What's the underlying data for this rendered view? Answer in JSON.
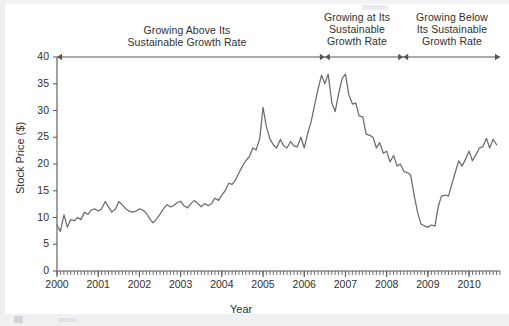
{
  "chart_data": {
    "type": "line",
    "title": "",
    "xlabel": "Year",
    "ylabel": "Stock Price ($)",
    "xlim": [
      2000,
      2010.75
    ],
    "ylim": [
      0,
      40
    ],
    "yticks": [
      0,
      5,
      10,
      15,
      20,
      25,
      30,
      35,
      40
    ],
    "xticks": [
      2000,
      2001,
      2002,
      2003,
      2004,
      2005,
      2006,
      2007,
      2008,
      2009,
      2010
    ],
    "xtick_labels": [
      "2000",
      "2001",
      "2002",
      "2003",
      "2004",
      "2005",
      "2006",
      "2007",
      "2008",
      "2009",
      "2010"
    ],
    "ytick_labels": [
      "0",
      "5",
      "10",
      "15",
      "20",
      "25",
      "30",
      "35",
      "40"
    ],
    "grid": false,
    "minor_ticks": "monthly",
    "line_color": "#6b6b6b",
    "axis_color": "#555555",
    "series": [
      {
        "name": "Stock Price",
        "x": [
          2000.0,
          2000.08,
          2000.17,
          2000.25,
          2000.33,
          2000.42,
          2000.5,
          2000.58,
          2000.67,
          2000.75,
          2000.83,
          2000.92,
          2001.0,
          2001.08,
          2001.17,
          2001.25,
          2001.33,
          2001.42,
          2001.5,
          2001.58,
          2001.67,
          2001.75,
          2001.83,
          2001.92,
          2002.0,
          2002.08,
          2002.17,
          2002.25,
          2002.33,
          2002.42,
          2002.5,
          2002.58,
          2002.67,
          2002.75,
          2002.83,
          2002.92,
          2003.0,
          2003.08,
          2003.17,
          2003.25,
          2003.33,
          2003.42,
          2003.5,
          2003.58,
          2003.67,
          2003.75,
          2003.83,
          2003.92,
          2004.0,
          2004.08,
          2004.17,
          2004.25,
          2004.33,
          2004.42,
          2004.5,
          2004.58,
          2004.67,
          2004.75,
          2004.83,
          2004.92,
          2005.0,
          2005.08,
          2005.17,
          2005.25,
          2005.33,
          2005.42,
          2005.5,
          2005.58,
          2005.67,
          2005.75,
          2005.83,
          2005.92,
          2006.0,
          2006.08,
          2006.17,
          2006.25,
          2006.33,
          2006.42,
          2006.5,
          2006.58,
          2006.67,
          2006.75,
          2006.83,
          2006.92,
          2007.0,
          2007.08,
          2007.17,
          2007.25,
          2007.33,
          2007.42,
          2007.5,
          2007.58,
          2007.67,
          2007.75,
          2007.83,
          2007.92,
          2008.0,
          2008.08,
          2008.17,
          2008.25,
          2008.33,
          2008.42,
          2008.5,
          2008.58,
          2008.67,
          2008.75,
          2008.83,
          2008.92,
          2009.0,
          2009.08,
          2009.17,
          2009.25,
          2009.33,
          2009.42,
          2009.5,
          2009.58,
          2009.67,
          2009.75,
          2009.83,
          2009.92,
          2010.0,
          2010.08,
          2010.17,
          2010.25,
          2010.33,
          2010.42,
          2010.5,
          2010.58,
          2010.67
        ],
        "values": [
          8.6,
          7.4,
          10.5,
          8.2,
          9.6,
          9.4,
          10.0,
          9.6,
          11.0,
          10.6,
          11.4,
          11.6,
          11.2,
          11.6,
          13.0,
          12.0,
          11.0,
          11.6,
          13.0,
          12.4,
          11.6,
          11.2,
          11.0,
          11.2,
          11.6,
          11.4,
          10.8,
          9.8,
          9.0,
          9.8,
          10.6,
          11.6,
          12.4,
          12.0,
          12.2,
          12.8,
          13.0,
          12.2,
          11.8,
          12.6,
          13.2,
          12.6,
          12.0,
          12.6,
          12.2,
          12.6,
          13.6,
          13.2,
          14.2,
          15.0,
          16.4,
          16.2,
          17.0,
          18.4,
          19.6,
          20.6,
          21.4,
          23.0,
          22.6,
          24.8,
          30.6,
          27.0,
          24.6,
          23.6,
          23.0,
          24.6,
          23.4,
          23.0,
          24.2,
          23.4,
          23.2,
          25.0,
          23.0,
          25.6,
          28.0,
          31.0,
          33.8,
          36.6,
          35.0,
          36.8,
          31.4,
          29.8,
          33.0,
          36.0,
          36.8,
          33.0,
          31.2,
          31.4,
          29.0,
          28.8,
          25.6,
          25.4,
          25.0,
          23.0,
          24.0,
          22.0,
          22.4,
          20.4,
          21.6,
          19.6,
          20.0,
          18.6,
          18.4,
          18.0,
          14.0,
          11.0,
          8.8,
          8.4,
          8.2,
          8.6,
          8.4,
          12.0,
          14.0,
          14.2,
          14.0,
          16.2,
          18.6,
          20.6,
          19.6,
          21.0,
          22.4,
          20.6,
          21.8,
          23.0,
          23.2,
          24.8,
          23.0,
          24.6,
          23.6
        ]
      }
    ],
    "annotations": [
      {
        "name": "growing-above-phase",
        "lines": [
          "Growing Above Its",
          "Sustainable Growth Rate"
        ],
        "bracket_start_year": 2000.0,
        "bracket_end_year": 2006.5
      },
      {
        "name": "growing-at-phase",
        "lines": [
          "Growing at Its",
          "Sustainable",
          "Growth Rate"
        ],
        "bracket_start_year": 2006.5,
        "bracket_end_year": 2008.4
      },
      {
        "name": "growing-below-phase",
        "lines": [
          "Growing Below",
          "Its Sustainable",
          "Growth Rate"
        ],
        "bracket_start_year": 2008.4,
        "bracket_end_year": 2010.75
      }
    ]
  }
}
